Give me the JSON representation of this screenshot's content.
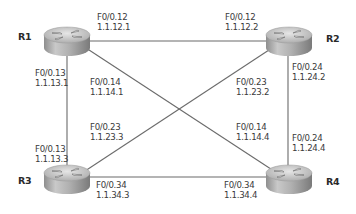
{
  "diagram": {
    "type": "network-topology",
    "routers": [
      {
        "id": "R1",
        "label": "R1"
      },
      {
        "id": "R2",
        "label": "R2"
      },
      {
        "id": "R3",
        "label": "R3"
      },
      {
        "id": "R4",
        "label": "R4"
      }
    ],
    "links": [
      {
        "from": "R1",
        "to": "R2",
        "a": {
          "iface": "F0/0.12",
          "ip": "1.1.12.1"
        },
        "b": {
          "iface": "F0/0.12",
          "ip": "1.1.12.2"
        }
      },
      {
        "from": "R1",
        "to": "R3",
        "a": {
          "iface": "F0/0.13",
          "ip": "1.1.13.1"
        },
        "b": {
          "iface": "F0/0.13",
          "ip": "1.1.13.3"
        }
      },
      {
        "from": "R1",
        "to": "R4",
        "a": {
          "iface": "F0/0.14",
          "ip": "1.1.14.1"
        },
        "b": {
          "iface": "F0/0.14",
          "ip": "1.1.14.4"
        }
      },
      {
        "from": "R2",
        "to": "R3",
        "a": {
          "iface": "F0/0.23",
          "ip": "1.1.23.2"
        },
        "b": {
          "iface": "F0/0.23",
          "ip": "1.1.23.3"
        }
      },
      {
        "from": "R2",
        "to": "R4",
        "a": {
          "iface": "F0/0.24",
          "ip": "1.1.24.2"
        },
        "b": {
          "iface": "F0/0.24",
          "ip": "1.1.24.4"
        }
      },
      {
        "from": "R3",
        "to": "R4",
        "a": {
          "iface": "F0/0.34",
          "ip": "1.1.34.3"
        },
        "b": {
          "iface": "F0/0.34",
          "ip": "1.1.34.4"
        }
      }
    ],
    "colors": {
      "link": "#6b6b6b",
      "text": "#3a3a3a",
      "router_body": "#a9a9a9"
    }
  }
}
